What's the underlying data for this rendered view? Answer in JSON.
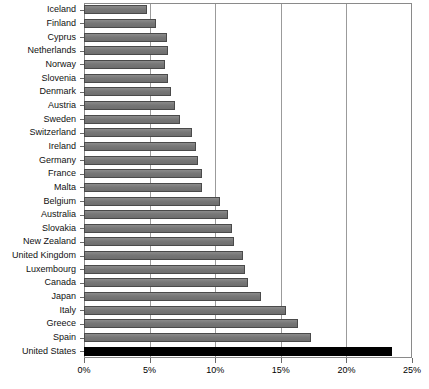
{
  "chart_data": {
    "type": "bar",
    "orientation": "horizontal",
    "title": "",
    "subtitle": "",
    "xlabel": "",
    "ylabel": "",
    "xlim": [
      0,
      25
    ],
    "xunit": "%",
    "grid": true,
    "legend": null,
    "xticks": [
      0,
      5,
      10,
      15,
      20,
      25
    ],
    "xticklabels": [
      "0%",
      "5%",
      "10%",
      "15%",
      "20%",
      "25%"
    ],
    "categories": [
      "Iceland",
      "Finland",
      "Cyprus",
      "Netherlands",
      "Norway",
      "Slovenia",
      "Denmark",
      "Austria",
      "Sweden",
      "Switzerland",
      "Ireland",
      "Germany",
      "France",
      "Malta",
      "Belgium",
      "Australia",
      "Slovakia",
      "New Zealand",
      "United Kingdom",
      "Luxembourg",
      "Canada",
      "Japan",
      "Italy",
      "Greece",
      "Spain",
      "United States"
    ],
    "values": [
      4.8,
      5.5,
      6.3,
      6.4,
      6.2,
      6.4,
      6.6,
      6.9,
      7.3,
      8.2,
      8.5,
      8.7,
      9.0,
      9.0,
      10.4,
      11.0,
      11.3,
      11.4,
      12.1,
      12.3,
      12.5,
      13.5,
      15.4,
      16.3,
      17.3,
      23.5
    ],
    "highlight_index": 25,
    "colors": {
      "bar": "#7a7a7a",
      "bar_border": "#4a4a4a",
      "highlight_bar": "#000000",
      "gridline": "#9b9b9b",
      "frame": "#8a8a8a",
      "text": "#111111",
      "background": "#ffffff"
    }
  }
}
